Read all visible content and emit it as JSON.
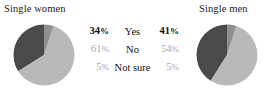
{
  "panels": [
    {
      "title": "Single women"
    },
    {
      "title": "Single men"
    }
  ],
  "legend": {
    "rows": [
      {
        "left": "34%",
        "label": "Yes",
        "right": "41%"
      },
      {
        "left": "61%",
        "label": "No",
        "right": "54%"
      },
      {
        "left": "5%",
        "label": "Not sure",
        "right": "5%"
      }
    ]
  },
  "colors": {
    "yes": "#4a4a4a",
    "no": "#b9b9b9",
    "not_sure": "#8f8f8f",
    "text_strong": "#111111",
    "text_muted": "#a8a8a8",
    "background": "#ffffff"
  },
  "chart_data": [
    {
      "type": "pie",
      "title": "Single women",
      "categories": [
        "Yes",
        "No",
        "Not sure"
      ],
      "values": [
        34,
        61,
        5
      ],
      "units": "percent",
      "colors": [
        "#4a4a4a",
        "#b9b9b9",
        "#8f8f8f"
      ],
      "start_angle_deg": 90,
      "direction": "counterclockwise",
      "legend": "center-shared",
      "grid": false
    },
    {
      "type": "pie",
      "title": "Single men",
      "categories": [
        "Yes",
        "No",
        "Not sure"
      ],
      "values": [
        41,
        54,
        5
      ],
      "units": "percent",
      "colors": [
        "#4a4a4a",
        "#b9b9b9",
        "#8f8f8f"
      ],
      "start_angle_deg": 90,
      "direction": "counterclockwise",
      "legend": "center-shared",
      "grid": false
    }
  ]
}
